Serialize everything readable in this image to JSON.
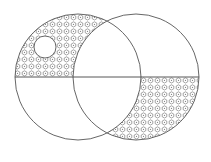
{
  "diagram": {
    "type": "geometric-shading-figure",
    "colors": {
      "stroke": "#555555",
      "hatch": "#666666",
      "background": "#ffffff"
    },
    "shapes": {
      "left_circle": {
        "cx": 78,
        "cy": 77,
        "r": 63
      },
      "right_circle": {
        "cx": 136,
        "cy": 77,
        "r": 63
      },
      "small_circle": {
        "cx": 45,
        "cy": 47,
        "r": 11
      },
      "horizontal_line": {
        "x1": 15,
        "y1": 77,
        "x2": 199,
        "y2": 77
      }
    },
    "shaded_regions": [
      "upper half of left circle outside right circle, excluding small circle",
      "lower half of right circle outside left circle"
    ]
  }
}
